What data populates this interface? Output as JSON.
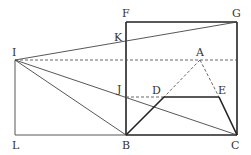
{
  "labels": {
    "F": "F",
    "G": "G",
    "K": "K",
    "I": "I",
    "A": "A",
    "J": "J",
    "D": "D",
    "E": "E",
    "L": "L",
    "B": "B",
    "C": "C"
  },
  "points": {
    "F": [
      126,
      22
    ],
    "G": [
      237,
      22
    ],
    "K": [
      126,
      41
    ],
    "I": [
      15,
      60
    ],
    "A": [
      200,
      60
    ],
    "J": [
      126,
      97
    ],
    "D": [
      164,
      97
    ],
    "E": [
      219,
      97
    ],
    "L": [
      15,
      135
    ],
    "B": [
      126,
      135
    ],
    "C": [
      237,
      135
    ]
  },
  "colors": {
    "line": "#222222",
    "background": "#ffffff"
  }
}
